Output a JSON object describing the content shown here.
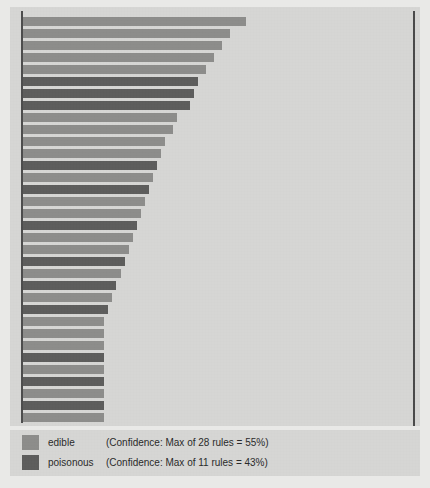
{
  "chart_data": {
    "type": "bar",
    "orientation": "horizontal",
    "title": "",
    "subtitle": "",
    "xlabel": "",
    "ylabel": "",
    "grid": false,
    "legend_position": "bottom-left",
    "axis": {
      "y_axis_visible": true,
      "right_reference_line_visible": true,
      "xlim": [
        0,
        100
      ],
      "tick_labels": []
    },
    "categories": [
      "rule-1",
      "rule-2",
      "rule-3",
      "rule-4",
      "rule-5",
      "rule-6",
      "rule-7",
      "rule-8",
      "rule-9",
      "rule-10",
      "rule-11",
      "rule-12",
      "rule-13",
      "rule-14",
      "rule-15",
      "rule-16",
      "rule-17",
      "rule-18",
      "rule-19",
      "rule-20",
      "rule-21",
      "rule-22",
      "rule-23",
      "rule-24",
      "rule-25",
      "rule-26",
      "rule-27",
      "rule-28",
      "rule-29",
      "rule-30",
      "rule-31",
      "rule-32",
      "rule-33",
      "rule-34"
    ],
    "values": [
      55,
      51,
      49,
      47,
      45,
      43,
      42,
      41,
      38,
      37,
      35,
      34,
      33,
      32,
      31,
      30,
      29,
      28,
      27,
      26,
      25,
      24,
      23,
      22,
      21,
      20,
      20,
      20,
      20,
      20,
      20,
      20,
      20,
      20
    ],
    "classes": [
      "edible",
      "edible",
      "edible",
      "edible",
      "edible",
      "poisonous",
      "poisonous",
      "poisonous",
      "edible",
      "edible",
      "edible",
      "edible",
      "poisonous",
      "edible",
      "poisonous",
      "edible",
      "edible",
      "poisonous",
      "edible",
      "edible",
      "poisonous",
      "edible",
      "poisonous",
      "edible",
      "poisonous",
      "edible",
      "edible",
      "edible",
      "poisonous",
      "edible",
      "poisonous",
      "edible",
      "poisonous",
      "edible"
    ],
    "series": [
      {
        "name": "edible",
        "color": "#8d8d8b"
      },
      {
        "name": "poisonous",
        "color": "#5d5d5c"
      }
    ]
  },
  "legend": {
    "entries": [
      {
        "swatch": "edible-swatch",
        "label": "edible",
        "note": "(Confidence: Max of 28 rules = 55%)",
        "color": "#8d8d8b",
        "rule_count": 28,
        "max_confidence": "55%"
      },
      {
        "swatch": "poisonous-swatch",
        "label": "poisonous",
        "note": "(Confidence: Max of 11 rules = 43%)",
        "color": "#5d5d5c",
        "rule_count": 11,
        "max_confidence": "43%"
      }
    ]
  },
  "colors": {
    "panel_background": "#d6d6d4",
    "page_background": "#e9e9e7",
    "axis_line": "#4d4d4d",
    "edible": "#8d8d8b",
    "poisonous": "#5d5d5c"
  }
}
